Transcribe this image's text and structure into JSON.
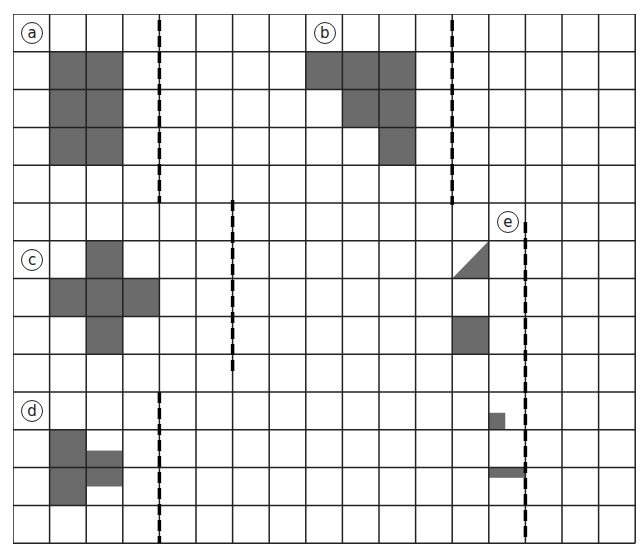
{
  "grid": {
    "cols": 17,
    "rows": 14,
    "cell_w": 36.6,
    "cell_h": 37.8,
    "line_color": "#222222",
    "fill_color": "#6b6b6b"
  },
  "figures": [
    {
      "label": "a",
      "label_cell": [
        0,
        0
      ],
      "shapes": [
        {
          "type": "rect",
          "col": 1,
          "row": 1,
          "w": 2,
          "h": 3
        }
      ],
      "mirror": {
        "col_line": 4,
        "y_from": 20,
        "y_to": 203
      }
    },
    {
      "label": "b",
      "label_cell": [
        8,
        0
      ],
      "shapes": [
        {
          "type": "rect",
          "col": 8,
          "row": 1,
          "w": 3,
          "h": 1
        },
        {
          "type": "rect",
          "col": 9,
          "row": 2,
          "w": 2,
          "h": 1
        },
        {
          "type": "rect",
          "col": 10,
          "row": 3,
          "w": 1,
          "h": 1
        }
      ],
      "mirror": {
        "col_line": 12,
        "y_from": 20,
        "y_to": 205
      }
    },
    {
      "label": "c",
      "label_cell": [
        0,
        6
      ],
      "shapes": [
        {
          "type": "rect",
          "col": 2,
          "row": 6,
          "w": 1,
          "h": 3
        },
        {
          "type": "rect",
          "col": 1,
          "row": 7,
          "w": 3,
          "h": 1
        }
      ],
      "mirror": {
        "col_line": 6,
        "y_from": 200,
        "y_to": 375
      }
    },
    {
      "label": "d",
      "label_cell": [
        0,
        10
      ],
      "shapes": [
        {
          "type": "rect",
          "col": 1,
          "row": 11,
          "w": 1,
          "h": 2
        },
        {
          "type": "rect",
          "col": 2,
          "row": 11.55,
          "w": 1,
          "h": 0.95
        }
      ],
      "mirror": {
        "col_line": 4,
        "y_from": 392,
        "y_to": 543
      }
    },
    {
      "label": "e",
      "label_cell": [
        13,
        5
      ],
      "shapes": [
        {
          "type": "tri",
          "col": 12,
          "row": 6
        },
        {
          "type": "rect",
          "col": 12,
          "row": 8,
          "w": 1,
          "h": 1
        },
        {
          "type": "rect",
          "col": 13,
          "row": 10.55,
          "w": 0.45,
          "h": 0.45
        },
        {
          "type": "rect",
          "col": 13,
          "row": 12.0,
          "w": 1,
          "h": 0.27
        }
      ],
      "mirror": {
        "col_line": 14,
        "y_from": 222,
        "y_to": 540
      }
    }
  ]
}
